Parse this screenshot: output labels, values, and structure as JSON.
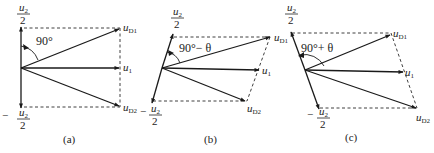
{
  "figure": {
    "panels": [
      {
        "id": "a",
        "caption": "(a)",
        "angle_label": "90°",
        "labels": {
          "u_d1": {
            "base": "u",
            "sub": "D1"
          },
          "u_1": {
            "base": "u",
            "sub": "1"
          },
          "u_d2": {
            "base": "u",
            "sub": "D2"
          },
          "top_frac": {
            "num_base": "u",
            "num_sub": "2",
            "den": "2",
            "sign": ""
          },
          "bottom_frac": {
            "num_base": "u",
            "num_sub": "2",
            "den": "2",
            "sign": "−"
          }
        }
      },
      {
        "id": "b",
        "caption": "(b)",
        "angle_label": "90°− θ",
        "labels": {
          "u_d1": {
            "base": "u",
            "sub": "D1"
          },
          "u_1": {
            "base": "u",
            "sub": "1"
          },
          "u_d2": {
            "base": "u",
            "sub": "D2"
          },
          "top_frac": {
            "num_base": "u",
            "num_sub": "2",
            "den": "2",
            "sign": ""
          },
          "bottom_frac": {
            "num_base": "u",
            "num_sub": "2",
            "den": "2",
            "sign": "−"
          }
        }
      },
      {
        "id": "c",
        "caption": "(c)",
        "angle_label": "90°+ θ",
        "labels": {
          "u_d1": {
            "base": "u",
            "sub": "D1"
          },
          "u_1": {
            "base": "u",
            "sub": "1"
          },
          "u_d2": {
            "base": "u",
            "sub": "D2"
          },
          "top_frac": {
            "num_base": "u",
            "num_sub": "2",
            "den": "2",
            "sign": ""
          },
          "bottom_frac": {
            "num_base": "u",
            "num_sub": "2",
            "den": "2",
            "sign": "−"
          }
        }
      }
    ]
  }
}
